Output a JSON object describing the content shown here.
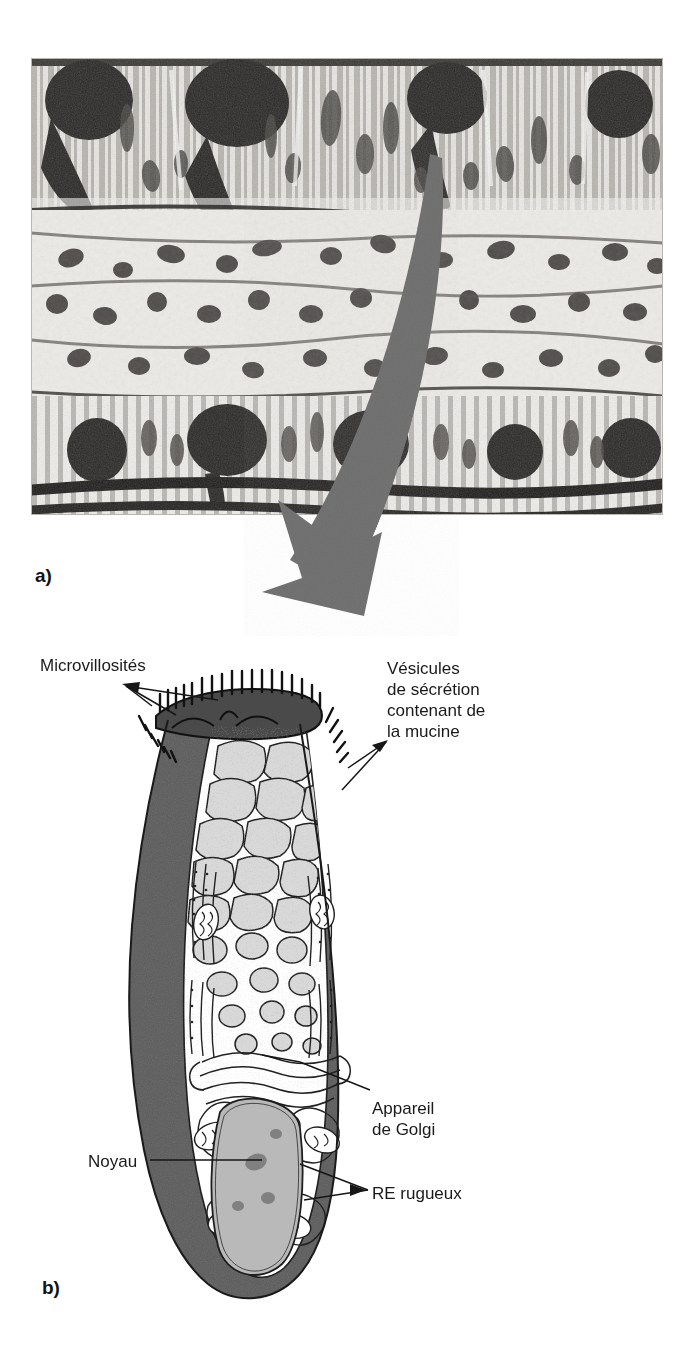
{
  "figure": {
    "panels": [
      {
        "id": "a",
        "letter": "a)",
        "kind": "light-micrograph",
        "caption_text": "Micrographie optique d'un épithélium intestinal montrant des cellules caliciformes"
      },
      {
        "id": "b",
        "letter": "b)",
        "kind": "schematic-drawing",
        "caption_text": "Schéma d'une cellule caliciforme en microscopie électronique"
      }
    ],
    "labels": {
      "microvillosites": "Microvillosités",
      "vesicules": "Vésicules\nde sécrétion\ncontenant de\nla mucine",
      "appareil_de_golgi": "Appareil\nde Golgi",
      "noyau": "Noyau",
      "re_rugueux": "RE rugueux"
    },
    "colors": {
      "arrow_gray": "#6e6e6e",
      "cell_dark_gray": "#5b5b5b",
      "vesicle_fill": "#d8d8d8",
      "nucleus_fill": "#b9b9b9",
      "apex_dark": "#4a4a4a",
      "ink": "#1a1a1a",
      "page_background": "#ffffff"
    }
  }
}
